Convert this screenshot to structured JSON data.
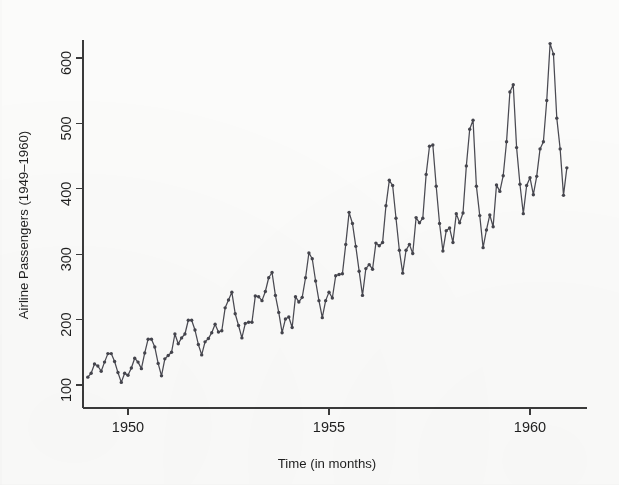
{
  "figure": {
    "background_color": "#fbfbfa",
    "ink_color": "#45454d",
    "axis_color": "#3a3a3a"
  },
  "chart_data": {
    "type": "line",
    "title": "",
    "subtitle": "",
    "xlabel": "Time (in months)",
    "ylabel": "Airline Passengers (1949–1960)",
    "xlim": [
      1948.9,
      1961.1
    ],
    "ylim": [
      85,
      640
    ],
    "grid": false,
    "legend": null,
    "legend_position": "none",
    "marker": "filled-circle",
    "line_style": "solid",
    "xticks": [
      1950,
      1955,
      1960
    ],
    "xticklabels": [
      "1950",
      "1955",
      "1960"
    ],
    "yticks": [
      100,
      200,
      300,
      400,
      500,
      600
    ],
    "yticklabels": [
      "100",
      "200",
      "300",
      "400",
      "500",
      "600"
    ],
    "x_start_year": 1949,
    "x_units": "decimal years (monthly steps of 1/12)",
    "series": [
      {
        "name": "Airline Passengers",
        "color": "#45454d",
        "values": [
          112,
          118,
          132,
          129,
          121,
          135,
          148,
          148,
          136,
          119,
          104,
          118,
          115,
          126,
          141,
          135,
          125,
          149,
          170,
          170,
          158,
          133,
          114,
          140,
          145,
          150,
          178,
          163,
          172,
          178,
          199,
          199,
          184,
          162,
          146,
          166,
          171,
          180,
          193,
          181,
          183,
          218,
          230,
          242,
          209,
          191,
          172,
          194,
          196,
          196,
          236,
          235,
          229,
          243,
          264,
          272,
          237,
          211,
          180,
          201,
          204,
          188,
          235,
          227,
          234,
          264,
          302,
          293,
          259,
          229,
          203,
          229,
          242,
          233,
          267,
          269,
          270,
          315,
          364,
          347,
          312,
          274,
          237,
          278,
          284,
          277,
          317,
          313,
          318,
          374,
          413,
          405,
          355,
          306,
          271,
          306,
          315,
          301,
          356,
          348,
          355,
          422,
          465,
          467,
          404,
          347,
          305,
          336,
          340,
          318,
          362,
          348,
          363,
          435,
          491,
          505,
          404,
          359,
          310,
          337,
          360,
          342,
          406,
          396,
          420,
          472,
          548,
          559,
          463,
          407,
          362,
          405,
          417,
          391,
          419,
          461,
          472,
          535,
          622,
          606,
          508,
          461,
          390,
          432
        ]
      }
    ],
    "n_points": 144,
    "value_min": 104,
    "value_max": 622
  }
}
